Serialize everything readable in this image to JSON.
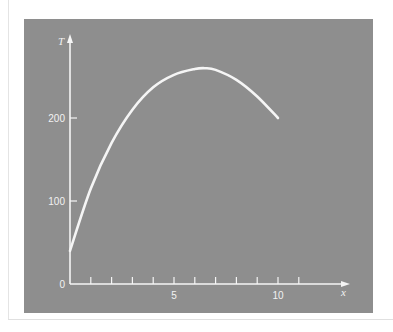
{
  "colors": {
    "panel_bg": "#8e8e8e",
    "page_bg": "#ffffff",
    "axis_and_curve": "#f5f5f5"
  },
  "chart_data": {
    "type": "line",
    "title": "",
    "xlabel": "x",
    "ylabel": "T",
    "x_ticks": [
      1,
      2,
      3,
      4,
      5,
      6,
      7,
      8,
      9,
      10,
      11
    ],
    "x_tick_labels": {
      "5": "5",
      "10": "10"
    },
    "y_ticks": [
      0,
      100,
      200
    ],
    "y_tick_labels": [
      "0",
      "100",
      "200"
    ],
    "xlim": [
      0,
      13
    ],
    "ylim": [
      0,
      300
    ],
    "grid": false,
    "legend": null,
    "series": [
      {
        "name": "T(x)",
        "x": [
          0,
          1,
          2,
          3,
          4,
          5,
          6,
          6.5,
          7,
          8,
          9,
          10
        ],
        "values": [
          40,
          115,
          170,
          210,
          237,
          252,
          259,
          260,
          258,
          246,
          226,
          200
        ]
      }
    ]
  }
}
